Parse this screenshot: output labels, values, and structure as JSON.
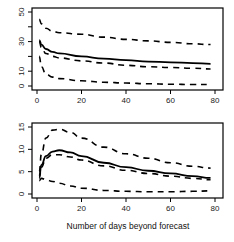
{
  "chart_data": [
    {
      "type": "line",
      "title": "",
      "xlabel": "",
      "ylabel": "",
      "xlim": [
        0,
        80
      ],
      "ylim": [
        0,
        50
      ],
      "x_ticks": [
        0,
        20,
        40,
        60,
        80
      ],
      "y_ticks": [
        0,
        10,
        20,
        30,
        40,
        50
      ],
      "y_tick_labels": [
        "0",
        "10",
        "",
        "30",
        "",
        "50"
      ],
      "grid": false,
      "x": [
        1,
        2,
        4,
        7,
        10,
        20,
        30,
        40,
        50,
        60,
        70,
        78
      ],
      "series": [
        {
          "name": "median",
          "style": "solid",
          "values": [
            31,
            28,
            25,
            23,
            22,
            20,
            18.5,
            17.5,
            16.5,
            16,
            15.5,
            15
          ]
        },
        {
          "name": "upper",
          "style": "dashed",
          "values": [
            45,
            42,
            39,
            37,
            36,
            35,
            33,
            31.5,
            30.5,
            29.5,
            28.5,
            28
          ]
        },
        {
          "name": "inner-lower",
          "style": "dashed",
          "values": [
            30,
            26,
            22,
            20,
            19,
            17,
            15.5,
            14,
            13,
            12.5,
            12,
            11.5
          ]
        },
        {
          "name": "lower",
          "style": "dashed",
          "values": [
            20,
            13,
            8,
            6,
            5,
            3.5,
            2.5,
            2,
            1.5,
            1.2,
            1,
            1
          ]
        }
      ]
    },
    {
      "type": "line",
      "title": "",
      "xlabel": "Number of days beyond forecast",
      "ylabel": "",
      "xlim": [
        0,
        80
      ],
      "ylim": [
        0,
        15
      ],
      "x_ticks": [
        0,
        20,
        40,
        60,
        80
      ],
      "y_ticks": [
        0,
        5,
        10,
        15
      ],
      "y_tick_labels": [
        "0",
        "5",
        "10",
        "15"
      ],
      "grid": false,
      "x": [
        1,
        2,
        4,
        7,
        10,
        15,
        20,
        30,
        40,
        50,
        60,
        70,
        78
      ],
      "series": [
        {
          "name": "median",
          "style": "solid",
          "values": [
            4,
            6.5,
            8.5,
            9.5,
            9.8,
            9.3,
            8.5,
            7,
            6,
            5.2,
            4.6,
            4,
            3.6
          ]
        },
        {
          "name": "upper",
          "style": "dashed",
          "values": [
            5,
            9,
            12.5,
            14.3,
            14.5,
            13.8,
            12.5,
            10.5,
            9,
            8,
            7,
            6.2,
            5.8
          ]
        },
        {
          "name": "inner-lower",
          "style": "dashed",
          "values": [
            3.5,
            6,
            8,
            8.8,
            8.8,
            8.3,
            7.6,
            6.3,
            5.3,
            4.6,
            4,
            3.5,
            3.2
          ]
        },
        {
          "name": "lower",
          "style": "dashed",
          "values": [
            3,
            3.5,
            3.2,
            2.8,
            2.4,
            1.8,
            1.3,
            0.8,
            0.6,
            0.5,
            0.5,
            0.6,
            0.7
          ]
        }
      ]
    }
  ],
  "panels": {
    "top": {
      "x_tick_labels": [
        "0",
        "20",
        "40",
        "60",
        "80"
      ],
      "y_tick_labels": [
        "0",
        "10",
        "30",
        "50"
      ]
    },
    "bottom": {
      "x_tick_labels": [
        "0",
        "20",
        "40",
        "60",
        "80"
      ],
      "y_tick_labels": [
        "0",
        "5",
        "10",
        "15"
      ]
    },
    "x_axis_title": "Number of days beyond forecast"
  },
  "colors": {
    "line": "#000000",
    "axis": "#000000",
    "background": "#ffffff"
  }
}
